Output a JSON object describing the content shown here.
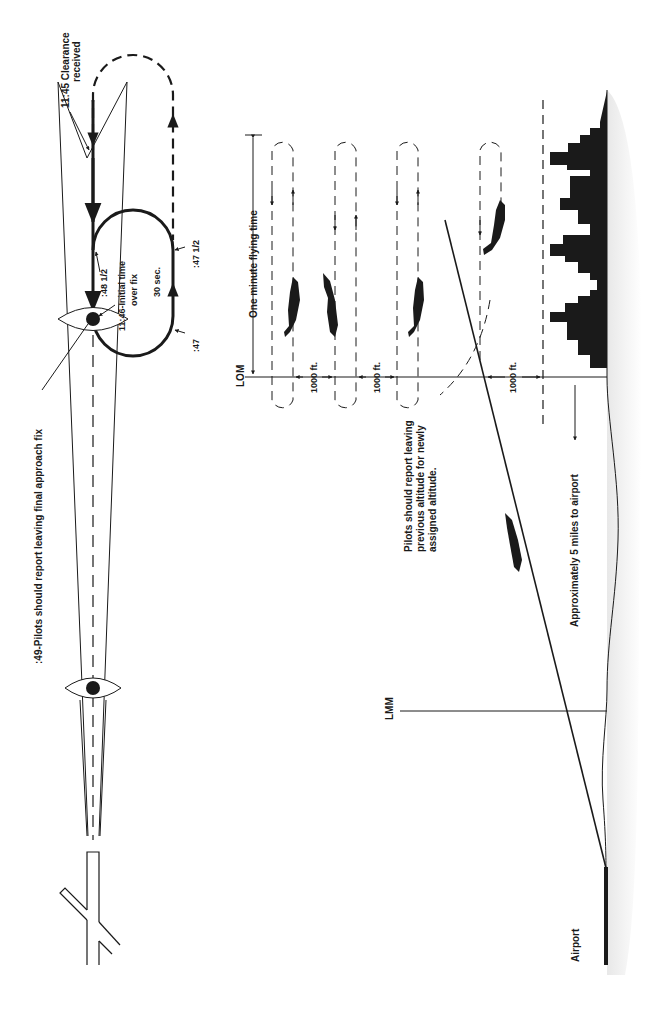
{
  "diagram": {
    "type": "holding pattern and approach profile",
    "orientation": "rotated 90 degrees clockwise",
    "colors": {
      "ink": "#1a1a1a",
      "background": "#ffffff",
      "ground_shade": "#e6e6e6"
    }
  },
  "plan_view": {
    "labels": {
      "clearance_time": "11:45 Clearance",
      "clearance_received": "received",
      "t48_half": ":48 1/2",
      "initial_time_1": "11:46-Initial time",
      "initial_time_2": "over fix",
      "thirty_sec": "30 sec.",
      "t47_half": ":47 1/2",
      "t47": ":47",
      "report_leaving": ":49-Pilots should report leaving final approach fix"
    }
  },
  "profile_view": {
    "labels": {
      "lom": "LOM",
      "one_minute": "One minute flying time",
      "sep1": "1000 ft.",
      "sep2": "1000 ft.",
      "sep3": "1000 ft.",
      "report_alt_1": "Pilots should report leaving",
      "report_alt_2": "previous altitude for newly",
      "report_alt_3": "assigned altitude.",
      "distance": "Approximately 5 miles to airport",
      "lmm": "LMM",
      "airport": "Airport"
    }
  }
}
